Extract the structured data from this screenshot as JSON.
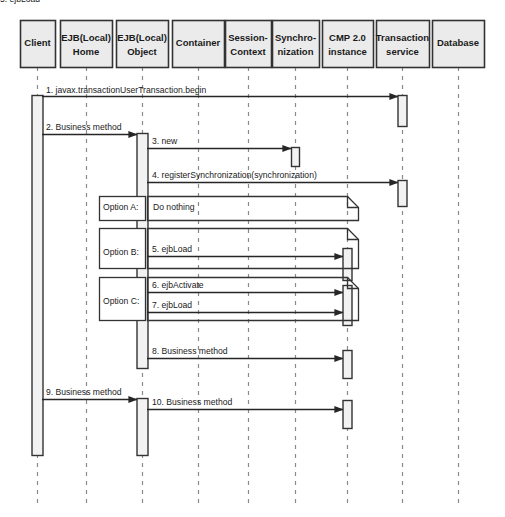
{
  "diagram": {
    "type": "uml-sequence-diagram",
    "width": 505,
    "height": 517,
    "colors": {
      "background": "#ffffff",
      "head_fill": "#ebebeb",
      "head_stroke": "#333333",
      "lifeline_stroke": "#8a8a8a",
      "activation_fill": "#f2f2f2",
      "activation_stroke": "#333333",
      "message_stroke": "#262626",
      "note_stroke": "#333333",
      "note_fill": "#ffffff",
      "text": "#1a1a1a"
    }
  },
  "lifelines": [
    {
      "id": "client",
      "label": "Client",
      "label2": "",
      "x": 37,
      "box_x": 20,
      "box_w": 35
    },
    {
      "id": "ejb_home",
      "label": "EJB(Local)",
      "label2": "Home",
      "x": 86,
      "box_x": 60,
      "box_w": 52
    },
    {
      "id": "ejb_object",
      "label": "EJB(Local)",
      "label2": "Object",
      "x": 142,
      "box_x": 116,
      "box_w": 52
    },
    {
      "id": "container",
      "label": "Container",
      "label2": "",
      "x": 198,
      "box_x": 172,
      "box_w": 52
    },
    {
      "id": "session_ctx",
      "label": "Session-",
      "label2": "Context",
      "x": 248,
      "box_x": 225,
      "box_w": 46
    },
    {
      "id": "sync",
      "label": "Synchro-",
      "label2": "nization",
      "x": 295,
      "box_x": 272,
      "box_w": 47
    },
    {
      "id": "cmp",
      "label": "CMP 2.0",
      "label2": "instance",
      "x": 347,
      "box_x": 322,
      "box_w": 51
    },
    {
      "id": "tx_service",
      "label": "Transaction",
      "label2": "service",
      "x": 402,
      "box_x": 376,
      "box_w": 53
    },
    {
      "id": "database",
      "label": "Database",
      "label2": "",
      "x": 458,
      "box_x": 432,
      "box_w": 52
    }
  ],
  "head_box": {
    "y": 20,
    "height": 47
  },
  "lifeline_span": {
    "top": 67,
    "bottom": 506
  },
  "activations": [
    {
      "id": "act-client",
      "lifeline": "client",
      "x": 37,
      "y": 95,
      "height": 360,
      "width": 11
    },
    {
      "id": "act-tx-begin",
      "lifeline": "tx_service",
      "x": 402,
      "y": 95,
      "height": 31,
      "width": 9
    },
    {
      "id": "act-obj-1",
      "lifeline": "ejb_object",
      "x": 142,
      "y": 133,
      "height": 235,
      "width": 11
    },
    {
      "id": "act-sync-new",
      "lifeline": "sync",
      "x": 295,
      "y": 147,
      "height": 19,
      "width": 8
    },
    {
      "id": "act-tx-register",
      "lifeline": "tx_service",
      "x": 402,
      "y": 180,
      "height": 26,
      "width": 9
    },
    {
      "id": "act-cmp-ejbload-b",
      "lifeline": "cmp",
      "x": 347,
      "y": 248,
      "height": 32,
      "width": 9
    },
    {
      "id": "act-cmp-optc",
      "lifeline": "cmp",
      "x": 347,
      "y": 285,
      "height": 40,
      "width": 9
    },
    {
      "id": "act-cmp-biz8",
      "lifeline": "cmp",
      "x": 347,
      "y": 350,
      "height": 28,
      "width": 9
    },
    {
      "id": "act-obj-2",
      "lifeline": "ejb_object",
      "x": 142,
      "y": 398,
      "height": 57,
      "width": 11
    },
    {
      "id": "act-cmp-biz10",
      "lifeline": "cmp",
      "x": 347,
      "y": 400,
      "height": 28,
      "width": 9
    }
  ],
  "messages": [
    {
      "id": "m1",
      "label": "1. javax.transactionUserTransaction.begin",
      "from": "client",
      "to": "tx_service",
      "from_x": 42,
      "to_x": 398,
      "y": 96,
      "label_x": 46,
      "label_y": 93
    },
    {
      "id": "m2",
      "label": "2. Business method",
      "from": "client",
      "to": "ejb_object",
      "from_x": 42,
      "to_x": 137,
      "y": 134,
      "label_x": 46,
      "label_y": 130
    },
    {
      "id": "m3",
      "label": "3. new",
      "from": "ejb_object",
      "to": "sync",
      "from_x": 147,
      "to_x": 291,
      "y": 148,
      "label_x": 152,
      "label_y": 144
    },
    {
      "id": "m4",
      "label": "4. registerSynchronization(synchronization)",
      "from": "ejb_object",
      "to": "tx_service",
      "from_x": 147,
      "to_x": 398,
      "y": 182,
      "label_x": 152,
      "label_y": 178
    },
    {
      "id": "m5",
      "label": "5. ejbLoad",
      "from": "ejb_object",
      "to": "cmp",
      "from_x": 147,
      "to_x": 343,
      "y": 256,
      "label_x": 152,
      "label_y": 252
    },
    {
      "id": "m6",
      "label": "6. ejbActivate",
      "from": "ejb_object",
      "to": "cmp",
      "from_x": 147,
      "to_x": 343,
      "y": 292,
      "label_x": 152,
      "label_y": 288
    },
    {
      "id": "m7",
      "label": "7. ejbLoad",
      "from": "ejb_object",
      "to": "cmp",
      "from_x": 147,
      "to_x": 343,
      "y": 312,
      "label_x": 152,
      "label_y": 308
    },
    {
      "id": "m8",
      "label": "8. Business method",
      "from": "ejb_object",
      "to": "cmp",
      "from_x": 147,
      "to_x": 343,
      "y": 358,
      "label_x": 152,
      "label_y": 354
    },
    {
      "id": "m9",
      "label": "9. Business method",
      "from": "client",
      "to": "ejb_object",
      "from_x": 42,
      "to_x": 137,
      "y": 399,
      "label_x": 46,
      "label_y": 395
    },
    {
      "id": "m10",
      "label": "10. Business method",
      "from": "ejb_object",
      "to": "cmp",
      "from_x": 147,
      "to_x": 343,
      "y": 409,
      "label_x": 152,
      "label_y": 405
    }
  ],
  "options": [
    {
      "id": "option-a",
      "tag": "Option A:",
      "text": "Do nothing",
      "tag_box": {
        "x": 99,
        "y": 196,
        "w": 46,
        "h": 24
      },
      "note_box": {
        "x": 147,
        "y": 196,
        "w": 211,
        "h": 24,
        "fold": 11
      },
      "tag_text_x": 103,
      "tag_text_y": 208,
      "note_text_x": 153,
      "note_text_y": 208
    },
    {
      "id": "option-b",
      "tag": "Option B:",
      "text": "5. ejbLoad",
      "tag_box": {
        "x": 99,
        "y": 228,
        "w": 46,
        "h": 40
      },
      "note_box": {
        "x": 147,
        "y": 228,
        "w": 211,
        "h": 40,
        "fold": 11
      },
      "tag_text_x": 103,
      "tag_text_y": 253,
      "note_text_x": 0,
      "note_text_y": 0
    },
    {
      "id": "option-c",
      "tag": "Option C:",
      "text": "",
      "tag_box": {
        "x": 99,
        "y": 277,
        "w": 46,
        "h": 43
      },
      "note_box": {
        "x": 147,
        "y": 277,
        "w": 211,
        "h": 43,
        "fold": 11
      },
      "tag_text_x": 103,
      "tag_text_y": 302,
      "note_text_x": 0,
      "note_text_y": 0
    }
  ]
}
